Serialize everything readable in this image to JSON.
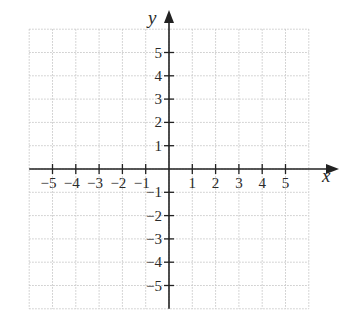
{
  "diagram": {
    "type": "cartesian-coordinate-grid",
    "x_axis": {
      "label": "x",
      "ticks": [
        "-5",
        "-4",
        "-3",
        "-2",
        "-1",
        "1",
        "2",
        "3",
        "4",
        "5"
      ]
    },
    "y_axis": {
      "label": "y",
      "ticks": [
        "5",
        "4",
        "3",
        "2",
        "1",
        "-1",
        "-2",
        "-3",
        "-4",
        "-5"
      ]
    },
    "grid": {
      "min": -6,
      "max": 6,
      "style": "dotted",
      "color": "#c8c8c8"
    },
    "axis_color": "#222222"
  },
  "chart_data": {
    "type": "scatter",
    "title": "",
    "xlabel": "x",
    "ylabel": "y",
    "xlim": [
      -6,
      6
    ],
    "ylim": [
      -6,
      6
    ],
    "x_ticks": [
      -5,
      -4,
      -3,
      -2,
      -1,
      1,
      2,
      3,
      4,
      5
    ],
    "y_ticks": [
      -5,
      -4,
      -3,
      -2,
      -1,
      1,
      2,
      3,
      4,
      5
    ],
    "grid": true,
    "series": []
  }
}
